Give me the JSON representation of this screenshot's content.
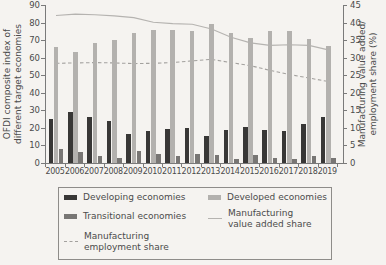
{
  "chart_data": {
    "type": "bar",
    "title": "",
    "categories": [
      "2005",
      "2006",
      "2007",
      "2008",
      "2009",
      "2010",
      "2011",
      "2012",
      "2013",
      "2014",
      "2015",
      "2016",
      "2017",
      "2018",
      "2019"
    ],
    "left_axis": {
      "label_lines": [
        "OFDI composite index of",
        "different target economies"
      ],
      "min": 0,
      "max": 90,
      "step": 10,
      "ticks": [
        0,
        10,
        20,
        30,
        40,
        50,
        60,
        70,
        80,
        90
      ]
    },
    "right_axis": {
      "label_lines": [
        "Manufacturing value added/",
        "employment share (%)"
      ],
      "min": 0,
      "max": 45,
      "step": 5,
      "ticks": [
        0,
        5,
        10,
        15,
        20,
        25,
        30,
        35,
        40,
        45
      ]
    },
    "grid": "off",
    "bar_series": [
      {
        "name": "Developing economies",
        "color": "#383736",
        "values": [
          25,
          29,
          26,
          24,
          16.5,
          18,
          19.5,
          20,
          15.5,
          19,
          20.5,
          19,
          18,
          22,
          26
        ]
      },
      {
        "name": "Developed economies",
        "color": "#b3b1ae",
        "values": [
          66,
          63,
          68.5,
          70,
          74,
          76,
          76,
          75,
          79,
          74,
          71,
          75,
          75,
          70.5,
          66.5
        ]
      },
      {
        "name": "Transitional economies",
        "color": "#787674",
        "values": [
          8,
          6.5,
          4,
          3,
          7,
          5,
          4,
          5,
          4.5,
          2.5,
          4.5,
          3,
          2.5,
          4,
          3
        ]
      }
    ],
    "line_series": [
      {
        "name": "Manufacturing value added share",
        "axis": "right",
        "style": "solid",
        "color": "#b5b3b0",
        "values": [
          42.0,
          42.4,
          42.2,
          41.9,
          41.4,
          40.1,
          39.7,
          39.5,
          38.2,
          35.8,
          34.2,
          33.5,
          33.7,
          33.5,
          32.2
        ]
      },
      {
        "name": "Manufacturing employment share",
        "axis": "right",
        "style": "dashed",
        "color": "#a3a19e",
        "values": [
          28.4,
          28.5,
          28.6,
          28.5,
          28.3,
          28.4,
          28.6,
          29.1,
          29.5,
          28.6,
          27.7,
          26.4,
          25.2,
          24.2,
          23.2
        ]
      }
    ],
    "legend": {
      "position": "bottom-boxed",
      "columns": [
        {
          "left": 5,
          "items": [
            {
              "swatch": "bar",
              "color": "#383736",
              "top": 4,
              "lines": [
                "Developing economies"
              ],
              "name": "developing-economies"
            },
            {
              "swatch": "bar",
              "color": "#787674",
              "top": 23,
              "lines": [
                "Transitional economies"
              ],
              "name": "transitional-economies"
            },
            {
              "swatch": "dashed-line",
              "color": "#a3a19e",
              "top": 43,
              "lines": [
                "Manufacturing",
                "employment share"
              ],
              "name": "manufacturing-employment-share"
            }
          ]
        },
        {
          "left": 149,
          "items": [
            {
              "swatch": "bar",
              "color": "#b3b1ae",
              "top": 4,
              "lines": [
                "Developed economies"
              ],
              "name": "developed-economies"
            },
            {
              "swatch": "solid-line",
              "color": "#b5b3b0",
              "top": 20,
              "lines": [
                "Manufacturing",
                "value added share"
              ],
              "name": "manufacturing-value-added-share"
            }
          ]
        }
      ]
    }
  }
}
